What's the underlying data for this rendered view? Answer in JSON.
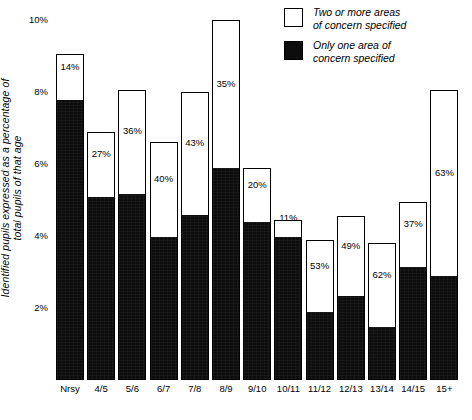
{
  "chart_data": {
    "type": "bar",
    "subtype": "stacked-bar",
    "title": "",
    "xlabel": "",
    "ylabel": "Identified pupils expressed as a percentage of total pupils of that age",
    "ylim": [
      0,
      10
    ],
    "yticks": [
      2,
      4,
      6,
      8,
      10
    ],
    "ytick_labels": [
      "2%",
      "4%",
      "6%",
      "8%",
      "10%"
    ],
    "grid": false,
    "legend_position": "top-right",
    "categories": [
      "Nrsy",
      "4/5",
      "5/6",
      "6/7",
      "7/8",
      "8/9",
      "9/10",
      "10/11",
      "11/12",
      "12/13",
      "13/14",
      "14/15",
      "15+"
    ],
    "series": [
      {
        "name": "Only one area of concern specified",
        "color": "#0d0d0d",
        "values": [
          7.75,
          5.05,
          5.15,
          3.95,
          4.55,
          5.85,
          4.35,
          3.95,
          1.85,
          2.3,
          1.45,
          3.1,
          2.85
        ]
      },
      {
        "name": "Two or more areas of concern specified",
        "color": "#ffffff",
        "values": [
          1.3,
          1.85,
          2.9,
          2.65,
          3.45,
          4.15,
          1.55,
          0.5,
          2.05,
          2.25,
          2.35,
          1.85,
          5.2
        ]
      }
    ],
    "totals": [
      9.05,
      6.9,
      8.05,
      6.6,
      8.0,
      10.0,
      5.9,
      4.45,
      3.9,
      4.55,
      3.8,
      4.95,
      8.05
    ],
    "white_share_labels": [
      "14%",
      "27%",
      "36%",
      "40%",
      "43%",
      "35%",
      "20%",
      "11%",
      "53%",
      "49%",
      "62%",
      "37%",
      "63%"
    ]
  },
  "axis": {
    "y_label_line1": "Identified pupils expressed as a percentage of",
    "y_label_line2": "total pupils of that age"
  },
  "legend": {
    "items": [
      {
        "swatch": "open-square-swatch",
        "line1": "Two or more areas",
        "line2": "of concern specified"
      },
      {
        "swatch": "filled-square-swatch",
        "line1": "Only one area of",
        "line2": "concern specified"
      }
    ]
  }
}
